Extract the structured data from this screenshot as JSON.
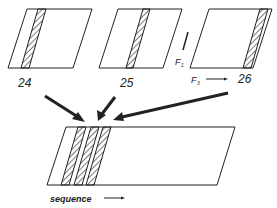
{
  "panels": [
    {
      "label": "24"
    },
    {
      "label": "25"
    },
    {
      "label": "26"
    }
  ],
  "axes": {
    "f1_label": "F",
    "f1_sub": "1",
    "f3_label": "F",
    "f3_sub": "3"
  },
  "combined": {
    "xlabel": "sequence"
  },
  "colors": {
    "stroke": "#222222",
    "background": "#ffffff"
  }
}
